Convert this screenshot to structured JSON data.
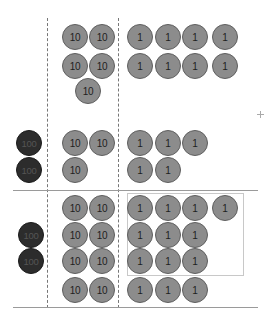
{
  "diagram": {
    "colors": {
      "chip_fill": "#8c8c8c",
      "chip_border": "#5e5e5e",
      "hundred_chip_fill": "#2c2c2c",
      "line": "#9a9a9a",
      "box": "#c8c8c8"
    },
    "columns": [
      "hundreds",
      "tens",
      "ones"
    ],
    "dividers": [
      {
        "x": 47,
        "y1": 18,
        "y2": 308
      },
      {
        "x": 118,
        "y1": 18,
        "y2": 308
      }
    ],
    "hlines": [
      {
        "x1": 13,
        "x2": 258,
        "y": 190
      },
      {
        "x1": 13,
        "x2": 258,
        "y": 307
      }
    ],
    "box": {
      "x": 127,
      "y": 193,
      "w": 117,
      "h": 83
    },
    "crosshair": {
      "x": 260,
      "y": 114
    },
    "chips": [
      {
        "label": "10",
        "kind": "v10",
        "cx": 75,
        "cy": 37
      },
      {
        "label": "10",
        "kind": "v10",
        "cx": 102,
        "cy": 37
      },
      {
        "label": "10",
        "kind": "v10",
        "cx": 75,
        "cy": 66
      },
      {
        "label": "10",
        "kind": "v10",
        "cx": 102,
        "cy": 66
      },
      {
        "label": "10",
        "kind": "v10",
        "cx": 88,
        "cy": 91
      },
      {
        "label": "1",
        "kind": "v1",
        "cx": 140,
        "cy": 37
      },
      {
        "label": "1",
        "kind": "v1",
        "cx": 168,
        "cy": 37
      },
      {
        "label": "1",
        "kind": "v1",
        "cx": 195,
        "cy": 37
      },
      {
        "label": "1",
        "kind": "v1",
        "cx": 225,
        "cy": 37
      },
      {
        "label": "1",
        "kind": "v1",
        "cx": 140,
        "cy": 66
      },
      {
        "label": "1",
        "kind": "v1",
        "cx": 168,
        "cy": 66
      },
      {
        "label": "1",
        "kind": "v1",
        "cx": 195,
        "cy": 66
      },
      {
        "label": "1",
        "kind": "v1",
        "cx": 225,
        "cy": 66
      },
      {
        "label": "100",
        "kind": "v100",
        "cx": 29,
        "cy": 143
      },
      {
        "label": "100",
        "kind": "v100",
        "cx": 29,
        "cy": 170
      },
      {
        "label": "10",
        "kind": "v10",
        "cx": 75,
        "cy": 143
      },
      {
        "label": "10",
        "kind": "v10",
        "cx": 102,
        "cy": 143
      },
      {
        "label": "10",
        "kind": "v10",
        "cx": 75,
        "cy": 170
      },
      {
        "label": "1",
        "kind": "v1",
        "cx": 140,
        "cy": 143
      },
      {
        "label": "1",
        "kind": "v1",
        "cx": 168,
        "cy": 143
      },
      {
        "label": "1",
        "kind": "v1",
        "cx": 195,
        "cy": 143
      },
      {
        "label": "1",
        "kind": "v1",
        "cx": 140,
        "cy": 170
      },
      {
        "label": "1",
        "kind": "v1",
        "cx": 168,
        "cy": 170
      },
      {
        "label": "10",
        "kind": "v10",
        "cx": 75,
        "cy": 208
      },
      {
        "label": "10",
        "kind": "v10",
        "cx": 102,
        "cy": 208
      },
      {
        "label": "100",
        "kind": "v100",
        "cx": 31,
        "cy": 235
      },
      {
        "label": "10",
        "kind": "v10",
        "cx": 75,
        "cy": 235
      },
      {
        "label": "10",
        "kind": "v10",
        "cx": 102,
        "cy": 235
      },
      {
        "label": "100",
        "kind": "v100",
        "cx": 31,
        "cy": 261
      },
      {
        "label": "10",
        "kind": "v10",
        "cx": 75,
        "cy": 261
      },
      {
        "label": "10",
        "kind": "v10",
        "cx": 102,
        "cy": 261
      },
      {
        "label": "10",
        "kind": "v10",
        "cx": 75,
        "cy": 290
      },
      {
        "label": "10",
        "kind": "v10",
        "cx": 102,
        "cy": 290
      },
      {
        "label": "1",
        "kind": "v1",
        "cx": 140,
        "cy": 208
      },
      {
        "label": "1",
        "kind": "v1",
        "cx": 168,
        "cy": 208
      },
      {
        "label": "1",
        "kind": "v1",
        "cx": 195,
        "cy": 208
      },
      {
        "label": "1",
        "kind": "v1",
        "cx": 225,
        "cy": 208
      },
      {
        "label": "1",
        "kind": "v1",
        "cx": 140,
        "cy": 235
      },
      {
        "label": "1",
        "kind": "v1",
        "cx": 168,
        "cy": 235
      },
      {
        "label": "1",
        "kind": "v1",
        "cx": 195,
        "cy": 235
      },
      {
        "label": "1",
        "kind": "v1",
        "cx": 140,
        "cy": 261
      },
      {
        "label": "1",
        "kind": "v1",
        "cx": 168,
        "cy": 261
      },
      {
        "label": "1",
        "kind": "v1",
        "cx": 195,
        "cy": 261
      },
      {
        "label": "1",
        "kind": "v1",
        "cx": 140,
        "cy": 290
      },
      {
        "label": "1",
        "kind": "v1",
        "cx": 168,
        "cy": 290
      },
      {
        "label": "1",
        "kind": "v1",
        "cx": 195,
        "cy": 290
      }
    ]
  }
}
